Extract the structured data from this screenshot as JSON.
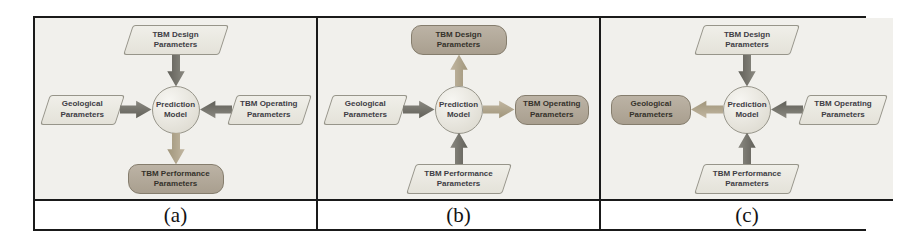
{
  "figure": {
    "colors": {
      "panel_background": "#f1f0ec",
      "input_shape_fill": "#e9e7df",
      "output_shape_fill": "#b1a898",
      "input_arrow": "#6f6e66",
      "output_arrow": "#b0a58c",
      "border": "#1a1a1a"
    },
    "panels": [
      {
        "caption": "(a)",
        "center_label": "Prediction Model",
        "nodes": {
          "top": {
            "label": "TBM Design Parameters",
            "role": "input",
            "arrow": "down input"
          },
          "left": {
            "label": "Geological Parameters",
            "role": "input",
            "arrow": "right input"
          },
          "right": {
            "label": "TBM Operating Parameters",
            "role": "input",
            "arrow": "left input"
          },
          "bottom": {
            "label": "TBM Performance Parameters",
            "role": "output",
            "arrow": "down output"
          }
        }
      },
      {
        "caption": "(b)",
        "center_label": "Prediction Model",
        "nodes": {
          "top": {
            "label": "TBM Design Parameters",
            "role": "output",
            "arrow": "up output"
          },
          "left": {
            "label": "Geological Parameters",
            "role": "input",
            "arrow": "right input"
          },
          "right": {
            "label": "TBM Operating Parameters",
            "role": "output",
            "arrow": "right output"
          },
          "bottom": {
            "label": "TBM Performance Parameters",
            "role": "input",
            "arrow": "up input"
          }
        }
      },
      {
        "caption": "(c)",
        "center_label": "Prediction Model",
        "nodes": {
          "top": {
            "label": "TBM Design Parameters",
            "role": "input",
            "arrow": "down input"
          },
          "left": {
            "label": "Geological Parameters",
            "role": "output",
            "arrow": "left output"
          },
          "right": {
            "label": "TBM Operating Parameters",
            "role": "input",
            "arrow": "left input"
          },
          "bottom": {
            "label": "TBM Performance Parameters",
            "role": "input",
            "arrow": "up input"
          }
        }
      }
    ]
  }
}
